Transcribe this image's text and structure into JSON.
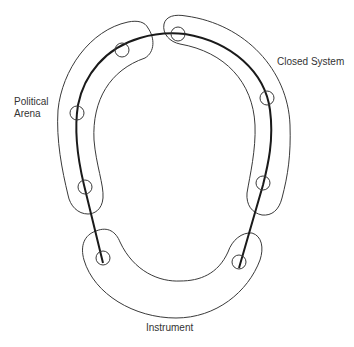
{
  "diagram": {
    "labels": {
      "political_arena_line1": "Political",
      "political_arena_line2": "Arena",
      "closed_system": "Closed System",
      "instrument": "Instrument"
    },
    "colors": {
      "stroke": "#3a3a3a",
      "path": "#1a1a1a",
      "text": "#333333",
      "background": "#ffffff"
    },
    "regions": [
      {
        "name": "Political Arena",
        "side": "left"
      },
      {
        "name": "Closed System",
        "side": "right"
      },
      {
        "name": "Instrument",
        "side": "bottom"
      }
    ],
    "nodes": [
      {
        "id": "n1",
        "x": 122,
        "y": 50
      },
      {
        "id": "n2",
        "x": 77,
        "y": 113
      },
      {
        "id": "n3",
        "x": 85,
        "y": 187
      },
      {
        "id": "n4",
        "x": 103,
        "y": 257
      },
      {
        "id": "n5",
        "x": 178,
        "y": 34
      },
      {
        "id": "n6",
        "x": 267,
        "y": 98
      },
      {
        "id": "n7",
        "x": 263,
        "y": 183
      },
      {
        "id": "n8",
        "x": 239,
        "y": 262
      }
    ]
  }
}
